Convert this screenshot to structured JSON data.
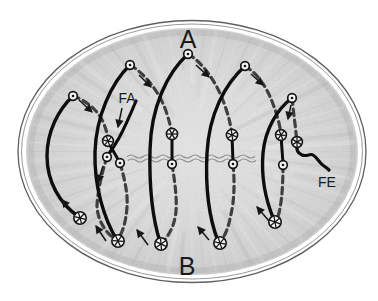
{
  "labels": {
    "anterior_pole": "A",
    "posterior_pole": "B",
    "fa": "FA",
    "fe": "FE"
  },
  "counts": {
    "top_nuclei": 5,
    "solid_arcs": 5,
    "dashed_paths": 5,
    "equatorial_asters": 5,
    "bottom_asters": 5,
    "arrows": 12
  },
  "icons": {
    "aster": "circle-with-radiating-spokes",
    "nucleus": "open-circle-with-center-dot",
    "arrowhead": "small-filled-triangle"
  },
  "colors": {
    "background": "#ffffff",
    "egg_fill_center": "#e7e7e7",
    "egg_fill_edge": "#c0c0c0",
    "egg_outline": "#5f5f5f",
    "solid_path": "#0d0d0d",
    "dashed_path": "#3f3f3f",
    "wavy_line": "#8e8e8e",
    "text": "#1a1a1a"
  }
}
